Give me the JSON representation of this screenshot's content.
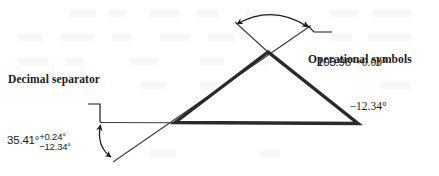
{
  "figure": {
    "background_color": "#ffffff",
    "ink_color": "#1c1c1c",
    "width": 439,
    "height": 176
  },
  "callouts": {
    "decimal_separator": {
      "label": "Decimal separator",
      "points_to": "decimal-point-in-35.41"
    },
    "operational_symbols": {
      "label": "Operational symbols",
      "points_to": "plus-minus-signs-in-tolerance"
    }
  },
  "annotations": {
    "upper_angle": {
      "name": "angle-dimension-upper",
      "nominal": "103.96°",
      "tolerance_upper": "+0.00°",
      "tolerance_lower": "−12.34°"
    },
    "lower_angle": {
      "name": "angle-dimension-lower",
      "nominal": "35.41°",
      "tolerance_upper": "+0.24°",
      "tolerance_lower": "−12.34°"
    }
  },
  "geometry": {
    "triangle": {
      "apex": [
        268,
        52
      ],
      "base_left": [
        175,
        122
      ],
      "base_right": [
        358,
        124
      ],
      "stroke_width": 3.4
    },
    "reference_line": {
      "from": [
        100,
        122
      ],
      "to": [
        358,
        123
      ],
      "stroke_width": 1.1
    },
    "crossing_line": {
      "from": [
        113,
        162
      ],
      "to": [
        311,
        25
      ],
      "stroke_width": 1.1
    },
    "upper_arc": {
      "start": [
        236,
        23
      ],
      "end": [
        309,
        26
      ],
      "arrowheads": "both"
    },
    "lower_arc": {
      "start": [
        100,
        124
      ],
      "end": [
        112,
        158
      ],
      "arrowheads": "both"
    }
  }
}
